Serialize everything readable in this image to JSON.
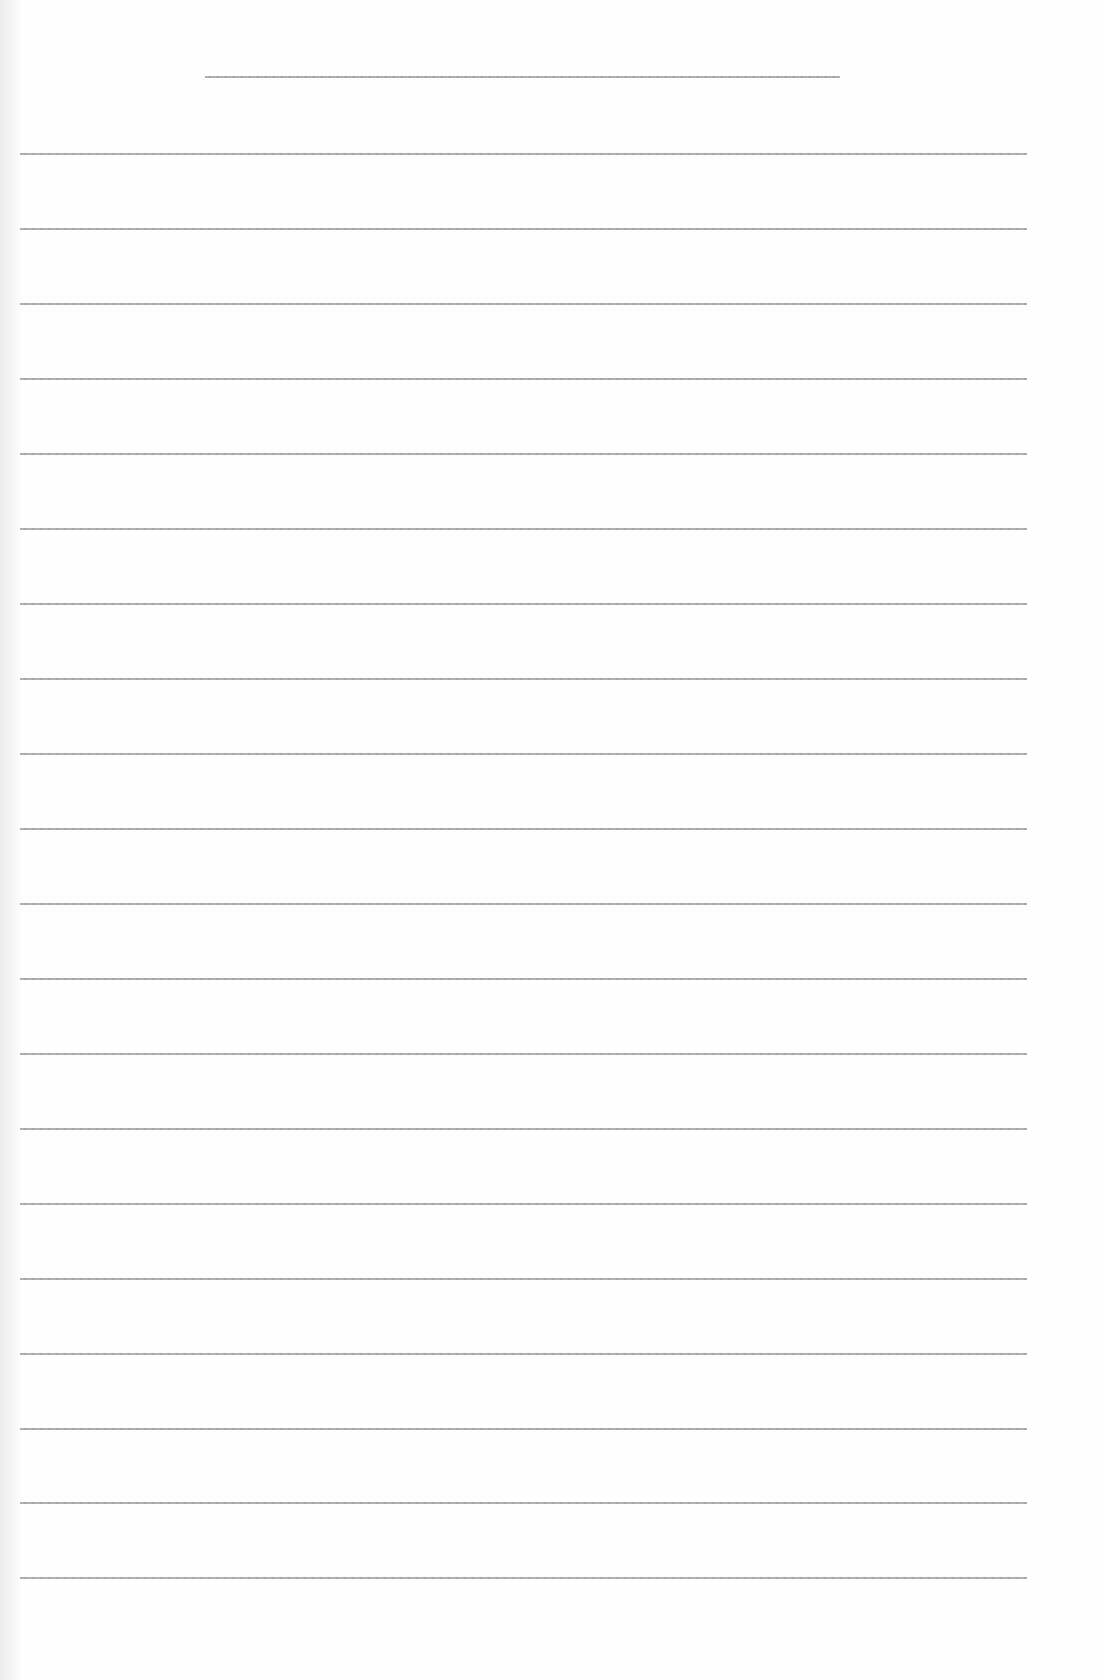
{
  "document": {
    "type": "lined-paper",
    "text_content": "",
    "colors": {
      "paper": "#fefefe",
      "rule": "#9a9a9a"
    },
    "title_line": {
      "y": 76,
      "x_start": 205,
      "x_end": 840
    },
    "ruled_lines": {
      "count": 20,
      "x_start": 20,
      "x_end": 1027,
      "y_positions": [
        153,
        228,
        303,
        378,
        453,
        528,
        603,
        678,
        753,
        828,
        903,
        978,
        1053,
        1128,
        1203,
        1278,
        1353,
        1428,
        1502,
        1577
      ]
    }
  }
}
